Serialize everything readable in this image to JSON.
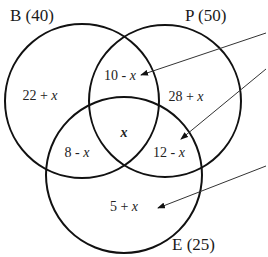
{
  "diagram": {
    "type": "venn-3-sets",
    "sets": [
      {
        "id": "B",
        "label": "B (40)",
        "name": "B",
        "total": 40
      },
      {
        "id": "P",
        "label": "P (50)",
        "name": "P",
        "total": 50
      },
      {
        "id": "E",
        "label": "E (25)",
        "name": "E",
        "total": 25
      }
    ],
    "regions": {
      "b_only": {
        "num": "22 + ",
        "var": "x"
      },
      "b_p": {
        "num": "10 - ",
        "var": "x"
      },
      "p_only": {
        "num": "28 + ",
        "var": "x"
      },
      "b_e": {
        "num": "8 - ",
        "var": "x"
      },
      "center": {
        "num": "",
        "var": "x"
      },
      "p_e": {
        "num": "12 - ",
        "var": "x"
      },
      "e_only": {
        "num": "5 + ",
        "var": "x"
      }
    },
    "arrows": [
      {
        "target": "b_p"
      },
      {
        "target": "p_e"
      },
      {
        "target": "e_only"
      }
    ],
    "colors": {
      "stroke": "#111111",
      "arrow": "#333333",
      "text": "#222222",
      "background": "#ffffff"
    }
  }
}
